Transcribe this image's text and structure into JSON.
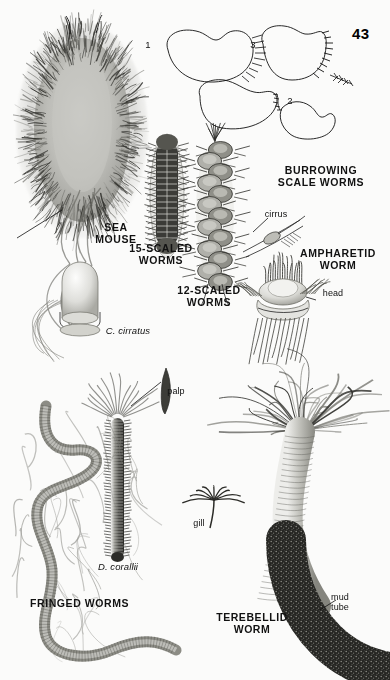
{
  "page": {
    "number": "43",
    "background_color": "#fbfbfa",
    "ink_color": "#111111"
  },
  "labels": {
    "sea_mouse": "SEA\nMOUSE",
    "scaled_15": "15-SCALED\nWORMS",
    "scaled_12": "12-SCALED\nWORMS",
    "burrowing_scale_worms": "BURROWING\nSCALE WORMS",
    "cirrus": "cirrus",
    "ampharetid_worm": "AMPHARETID\nWORM",
    "head": "head",
    "c_cirratus": "C. cirratus",
    "palp": "palp",
    "d_corallii": "D. corallii",
    "fringed_worms": "FRINGED WORMS",
    "gill": "gill",
    "terebellid_worm": "TEREBELLID\nWORM",
    "mud_tube": "mud\ntube"
  },
  "burrow_diagram": {
    "step_1": "1",
    "step_2": "2",
    "step_3": "3"
  }
}
